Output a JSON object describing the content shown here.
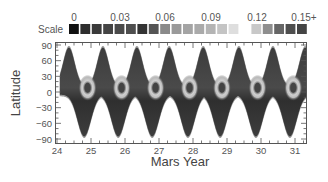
{
  "chart_data": {
    "type": "heatmap",
    "title": "",
    "xlabel": "Mars Year",
    "ylabel": "Latitude",
    "xlim": [
      24,
      31.35
    ],
    "ylim": [
      -90,
      90
    ],
    "x_ticks": [
      24,
      25,
      26,
      27,
      28,
      29,
      30,
      31
    ],
    "x_tick_labels": [
      "24",
      "25",
      "26",
      "27",
      "28",
      "29",
      "30",
      "31"
    ],
    "y_ticks": [
      90,
      60,
      30,
      0,
      -30,
      -60,
      -90
    ],
    "y_tick_labels": [
      "90",
      "60",
      "30",
      "0",
      "-30",
      "-60",
      "-90"
    ],
    "colorbar": {
      "label": "Scale",
      "position": "top",
      "tick_labels": [
        "0",
        "0.03",
        "0.06",
        "0.09",
        "0.12",
        "0.15+"
      ],
      "range": [
        0,
        0.15
      ],
      "swatches": [
        "#111111",
        "#2e2e2e",
        "#3a3a3a",
        "#444444",
        "#4a4a4a",
        "#4e4e4e",
        "#333333",
        "#555555",
        "#8a8a8a",
        "#9a9a9a",
        "#a4a4a4",
        "#aaaaaa",
        "#b4b4b4",
        "#c4c4c4",
        "#dedede",
        "#ffffff",
        "#c8c8c8",
        "#8e8e8e",
        "#666666",
        "#4e4e4e",
        "#444444"
      ]
    },
    "grid": false,
    "annual_features": [
      {
        "year": 24,
        "north_peak_x": 24.35,
        "south_peak_x": 24.8,
        "ring_x": 24.9
      },
      {
        "year": 25,
        "north_peak_x": 25.35,
        "south_peak_x": 25.8,
        "ring_x": 25.9
      },
      {
        "year": 26,
        "north_peak_x": 26.35,
        "south_peak_x": 26.8,
        "ring_x": 26.9
      },
      {
        "year": 27,
        "north_peak_x": 27.3,
        "south_peak_x": 27.85,
        "ring_x": 27.9
      },
      {
        "year": 28,
        "north_peak_x": 28.3,
        "south_peak_x": 28.8,
        "ring_x": 28.85
      },
      {
        "year": 29,
        "north_peak_x": 29.35,
        "south_peak_x": 29.85,
        "ring_x": 29.9
      },
      {
        "year": 30,
        "north_peak_x": 30.35,
        "south_peak_x": 30.85,
        "ring_x": 30.95
      },
      {
        "year": 31,
        "north_peak_x": 31.3,
        "south_peak_x": null,
        "ring_x": null
      }
    ]
  }
}
